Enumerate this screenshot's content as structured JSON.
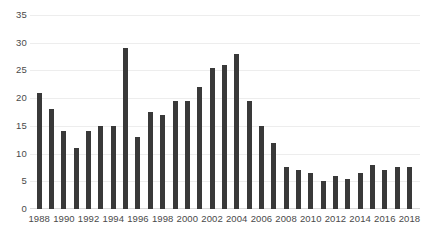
{
  "chart_data": {
    "type": "bar",
    "title": "",
    "subtitle": "",
    "xlabel": "",
    "ylabel": "",
    "grid": true,
    "legend": false,
    "legend_position": "none",
    "bar_color": "#393939",
    "gridline_color": "#ededed",
    "ylim": [
      0,
      35
    ],
    "ytick_step": 5,
    "ytick_labels": [
      "0",
      "5",
      "10",
      "15",
      "20",
      "25",
      "30",
      "35"
    ],
    "ytick_values": [
      0,
      5,
      10,
      15,
      20,
      25,
      30,
      35
    ],
    "xtick_labels": [
      "1988",
      "1990",
      "1992",
      "1994",
      "1996",
      "1998",
      "2000",
      "2002",
      "2004",
      "2006",
      "2008",
      "2010",
      "2012",
      "2014",
      "2016",
      "2018"
    ],
    "xtick_values": [
      1988,
      1990,
      1992,
      1994,
      1996,
      1998,
      2000,
      2002,
      2004,
      2006,
      2008,
      2010,
      2012,
      2014,
      2016,
      2018
    ],
    "categories": [
      "1988",
      "1989",
      "1990",
      "1991",
      "1992",
      "1993",
      "1994",
      "1995",
      "1996",
      "1997",
      "1998",
      "1999",
      "2000",
      "2001",
      "2002",
      "2003",
      "2004",
      "2005",
      "2006",
      "2007",
      "2008",
      "2009",
      "2010",
      "2011",
      "2012",
      "2013",
      "2014",
      "2015",
      "2016",
      "2017",
      "2018"
    ],
    "values": [
      21,
      18,
      14,
      11,
      14,
      15,
      15,
      29,
      13,
      17.5,
      17,
      19.5,
      19.5,
      22,
      25.5,
      26,
      28,
      19.5,
      15,
      12,
      7.5,
      7,
      6.5,
      5,
      6,
      5.5,
      6.5,
      8,
      7,
      7.5,
      7.5
    ],
    "series": [
      {
        "name": "Count",
        "values": [
          21,
          18,
          14,
          11,
          14,
          15,
          15,
          29,
          13,
          17.5,
          17,
          19.5,
          19.5,
          22,
          25.5,
          26,
          28,
          19.5,
          15,
          12,
          7.5,
          7,
          6.5,
          5,
          6,
          5.5,
          6.5,
          8,
          7,
          7.5,
          7.5
        ]
      }
    ]
  }
}
